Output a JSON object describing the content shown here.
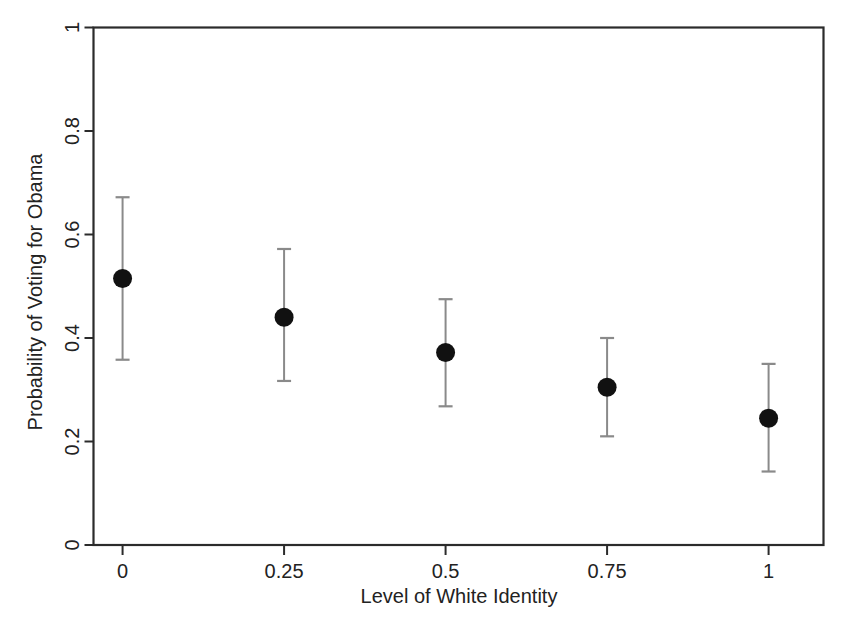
{
  "chart_data": {
    "type": "scatter",
    "title": "",
    "xlabel": "Level of White Identity",
    "ylabel": "Probability of Voting for Obama",
    "xlim": [
      -0.045,
      1.085
    ],
    "ylim": [
      0,
      1
    ],
    "grid": false,
    "legend": null,
    "x_ticks": [
      0,
      0.25,
      0.5,
      0.75,
      1
    ],
    "x_tick_labels": [
      "0",
      "0.25",
      "0.5",
      "0.75",
      "1"
    ],
    "y_ticks": [
      0,
      0.2,
      0.4,
      0.6,
      0.8,
      1
    ],
    "y_tick_labels": [
      "0",
      "0.2",
      "0.4",
      "0.6",
      "0.8",
      "1"
    ],
    "x": [
      0,
      0.25,
      0.5,
      0.75,
      1
    ],
    "values": [
      0.515,
      0.44,
      0.372,
      0.305,
      0.245
    ],
    "error_low": [
      0.358,
      0.317,
      0.268,
      0.21,
      0.142
    ],
    "error_high": [
      0.672,
      0.572,
      0.475,
      0.4,
      0.35
    ],
    "point_color": "#111111",
    "errorbar_color": "#8a8a8a",
    "axis_color": "#2b2b2b",
    "background": "#ffffff",
    "series": [
      {
        "name": "Predicted probability",
        "values": [
          0.515,
          0.44,
          0.372,
          0.305,
          0.245
        ]
      }
    ],
    "points": [
      {
        "x": 0,
        "x_label": "0",
        "y": 0.515,
        "ci_low": 0.358,
        "ci_high": 0.672
      },
      {
        "x": 0.25,
        "x_label": "0.25",
        "y": 0.44,
        "ci_low": 0.317,
        "ci_high": 0.572
      },
      {
        "x": 0.5,
        "x_label": "0.5",
        "y": 0.372,
        "ci_low": 0.268,
        "ci_high": 0.475
      },
      {
        "x": 0.75,
        "x_label": "0.75",
        "y": 0.305,
        "ci_low": 0.21,
        "ci_high": 0.4
      },
      {
        "x": 1,
        "x_label": "1",
        "y": 0.245,
        "ci_low": 0.142,
        "ci_high": 0.35
      }
    ]
  },
  "axes": {
    "x_title": "Level of White Identity",
    "y_title": "Probability of Voting for Obama",
    "x_tick_labels": [
      "0",
      "0.25",
      "0.5",
      "0.75",
      "1"
    ],
    "y_tick_labels": [
      "0",
      "0.2",
      "0.4",
      "0.6",
      "0.8",
      "1"
    ]
  }
}
